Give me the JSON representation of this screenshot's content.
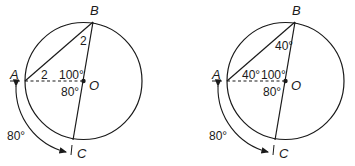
{
  "diagrams": [
    {
      "id": "left",
      "points": {
        "A": "A",
        "B": "B",
        "O": "O",
        "C": "C"
      },
      "labels": {
        "angle_OBA": "2",
        "angle_OAB": "2",
        "angle_AOB": "100°",
        "angle_AOC": "80°",
        "arc_AC": "80°"
      }
    },
    {
      "id": "right",
      "points": {
        "A": "A",
        "B": "B",
        "O": "O",
        "C": "C"
      },
      "labels": {
        "angle_OBA": "40°",
        "angle_OAB": "40°",
        "angle_AOB": "100°",
        "angle_AOC": "80°",
        "arc_AC": "80°"
      }
    }
  ]
}
